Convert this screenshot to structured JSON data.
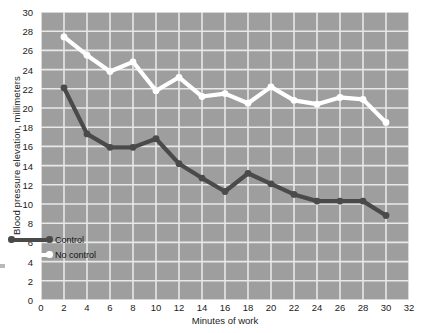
{
  "chart_data": {
    "type": "line",
    "title": "",
    "xlabel": "Minutes of work",
    "ylabel": "Blood pressure elevation, millimeters",
    "xlim": [
      0,
      32
    ],
    "ylim": [
      0,
      30
    ],
    "xticks": [
      0,
      2,
      4,
      6,
      8,
      10,
      12,
      14,
      16,
      18,
      20,
      22,
      24,
      26,
      28,
      30,
      32
    ],
    "yticks": [
      0,
      2,
      4,
      6,
      8,
      10,
      12,
      14,
      16,
      18,
      20,
      22,
      24,
      26,
      28,
      30
    ],
    "grid": true,
    "legend_position": "lower left",
    "plot_background": "#9e9e9e",
    "grid_color": "#e8e8e8",
    "x": [
      2,
      4,
      6,
      8,
      10,
      12,
      14,
      16,
      18,
      20,
      22,
      24,
      26,
      28,
      30
    ],
    "series": [
      {
        "name": "Control",
        "color": "#4a4a4a",
        "marker": "circle-filled-dark",
        "values": [
          22.1,
          17.3,
          15.9,
          15.9,
          16.8,
          14.2,
          12.7,
          11.3,
          13.2,
          12.1,
          11.0,
          10.3,
          10.3,
          10.3,
          8.8
        ]
      },
      {
        "name": "No control",
        "color": "#ffffff",
        "marker": "circle-filled-white",
        "values": [
          27.4,
          25.5,
          23.8,
          24.8,
          21.8,
          23.2,
          21.2,
          21.5,
          20.5,
          22.2,
          20.8,
          20.4,
          21.1,
          20.9,
          18.5
        ]
      }
    ]
  },
  "legend": {
    "items": [
      {
        "label": "Control"
      },
      {
        "label": "No control"
      }
    ]
  }
}
